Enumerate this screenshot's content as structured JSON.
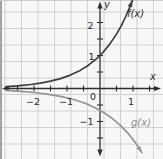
{
  "colors": {
    "background": "#f7f8f5",
    "grid": "#cdd3d0",
    "axis": "#2e2e2e",
    "text": "#2b2b2b",
    "f_curve": "#3d3d3d",
    "g_curve": "#949494",
    "edge_left": "#a0a5a2",
    "edge_top": "#c9cec9"
  },
  "chart_data": {
    "type": "line",
    "title": "",
    "xlabel": "x",
    "ylabel": "y",
    "x_range": [
      -3,
      1.9
    ],
    "y_range": [
      -2.15,
      2.65
    ],
    "grid": true,
    "legend": "curve labels inline on plot",
    "x_tick_labels": [
      {
        "text": "−2",
        "value": -2
      },
      {
        "text": "−1",
        "value": -1
      },
      {
        "text": "0",
        "value": 0
      },
      {
        "text": "1",
        "value": 1
      }
    ],
    "y_tick_labels": [
      {
        "text": "2",
        "value": 2
      },
      {
        "text": "1",
        "value": 1
      },
      {
        "text": "−1",
        "value": -1
      }
    ],
    "series": [
      {
        "id": "f",
        "name": "f(x)",
        "description": "increasing exponential curve through (0,1), asymptotic to x-axis on the left, arrow at upper right",
        "color": "#3d3d3d",
        "points": [
          [
            -2.85,
            0.058
          ],
          [
            -2.5,
            0.082
          ],
          [
            -2.1,
            0.122
          ],
          [
            -1.8,
            0.165
          ],
          [
            -1.5,
            0.223
          ],
          [
            -1.2,
            0.301
          ],
          [
            -0.9,
            0.407
          ],
          [
            -0.6,
            0.549
          ],
          [
            -0.35,
            0.705
          ],
          [
            -0.1,
            0.905
          ],
          [
            0.1,
            1.105
          ],
          [
            0.3,
            1.35
          ],
          [
            0.5,
            1.649
          ],
          [
            0.65,
            1.916
          ],
          [
            0.78,
            2.181
          ],
          [
            0.88,
            2.411
          ],
          [
            0.98,
            2.664
          ]
        ]
      },
      {
        "id": "g",
        "name": "g(x)",
        "description": "decreasing reflected curve below x-axis through about (0,−0.66), asymptotic to x-axis on the left, arrow at lower right",
        "color": "#949494",
        "points": [
          [
            -2.85,
            -0.059
          ],
          [
            -2.4,
            -0.086
          ],
          [
            -2.0,
            -0.121
          ],
          [
            -1.6,
            -0.169
          ],
          [
            -1.2,
            -0.238
          ],
          [
            -0.8,
            -0.334
          ],
          [
            -0.45,
            -0.45
          ],
          [
            -0.15,
            -0.581
          ],
          [
            0.1,
            -0.719
          ],
          [
            0.35,
            -0.889
          ],
          [
            0.6,
            -1.099
          ],
          [
            0.85,
            -1.359
          ],
          [
            1.05,
            -1.611
          ],
          [
            1.27,
            -1.943
          ]
        ]
      }
    ],
    "layout": {
      "canvas": {
        "width": 163,
        "height": 159
      },
      "origin_px": {
        "x": 100,
        "y": 88.5
      },
      "px_per_unit": {
        "x": 33,
        "y": 33
      },
      "grid_px": {
        "spacing": 16.5,
        "x_offset": 5,
        "y_offset": 12
      },
      "axis": {
        "x_line": [
          4,
          158
        ],
        "y_line": [
          5,
          153
        ],
        "arrow_tips": {
          "left": [
            2,
            88.5
          ],
          "right": [
            161,
            88.5
          ],
          "top": [
            100,
            1.5
          ],
          "bottom": [
            100,
            156.5
          ]
        }
      },
      "ticks": {
        "x": [
          -2.5,
          -2,
          -1.5,
          -1,
          -0.5,
          0.5,
          1,
          1.5
        ],
        "y": [
          2,
          1.5,
          1,
          0.5,
          -0.5,
          -1,
          -1.5
        ],
        "half_len": 3
      }
    }
  }
}
